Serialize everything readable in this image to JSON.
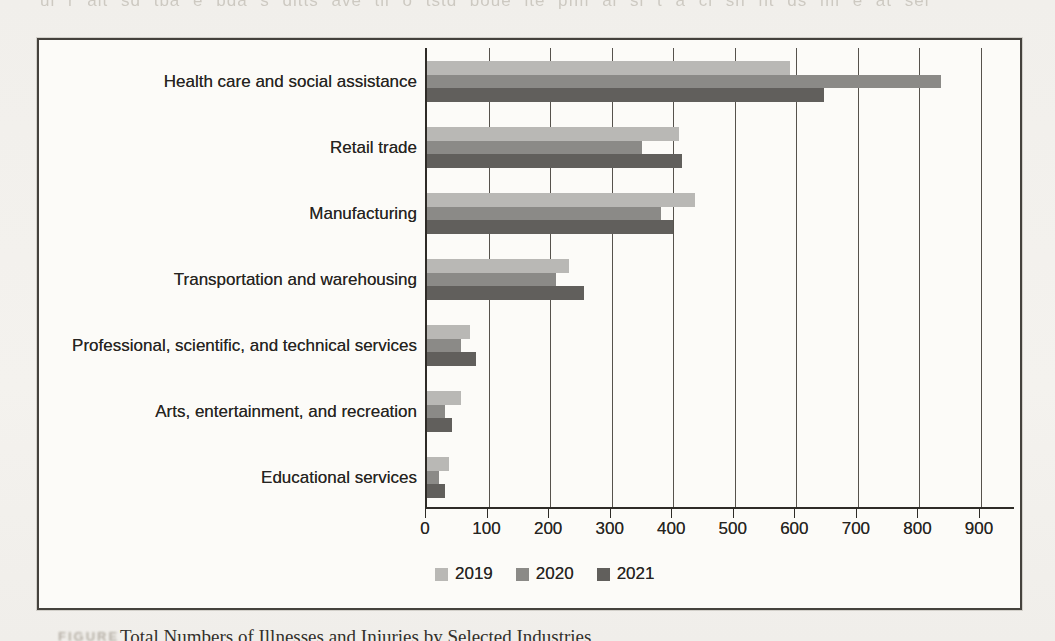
{
  "page": {
    "kind": "scanned book page with bar chart",
    "background_color": "#f2f0ec",
    "frame_color": "#45423d"
  },
  "ghosts": {
    "top": "ul r alt sd tba e bda s dltts ave tll o tstd boue lte pfm al sl t a cl sh nt ds ml e at sel",
    "fragments": [
      {
        "text": "tr ts al r hale d ms t",
        "x": 600,
        "y": 158,
        "size": 16
      },
      {
        "text": "a e sartt es e al st ie as",
        "x": 435,
        "y": 224,
        "size": 16
      },
      {
        "text": "te sal ees lsn t",
        "x": 640,
        "y": 340,
        "size": 16
      },
      {
        "text": "st a es t e",
        "x": 580,
        "y": 541,
        "size": 15
      }
    ]
  },
  "chart_data": {
    "type": "bar",
    "orientation": "horizontal",
    "title": "",
    "xlabel": "",
    "ylabel": "",
    "xlim": [
      0,
      900
    ],
    "x_ticks": [
      0,
      100,
      200,
      300,
      400,
      500,
      600,
      700,
      800,
      900
    ],
    "grid": true,
    "legend_position": "bottom",
    "categories": [
      "Health care and social assistance",
      "Retail trade",
      "Manufacturing",
      "Transportation and warehousing",
      "Professional, scientific, and technical services",
      "Arts, entertainment, and recreation",
      "Educational services"
    ],
    "series": [
      {
        "name": "2019",
        "color": "#b9b8b5",
        "values": [
          590,
          410,
          435,
          230,
          70,
          55,
          35
        ]
      },
      {
        "name": "2020",
        "color": "#8b8a87",
        "values": [
          835,
          350,
          380,
          210,
          55,
          30,
          20
        ]
      },
      {
        "name": "2021",
        "color": "#615f5c",
        "values": [
          645,
          415,
          400,
          255,
          80,
          40,
          30
        ]
      }
    ]
  },
  "caption": {
    "label": "FIGURE",
    "text": "Total Numbers of Illnesses and Injuries by Selected Industries"
  }
}
